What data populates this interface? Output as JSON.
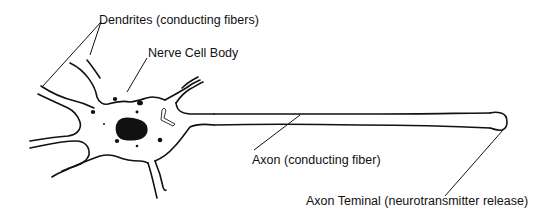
{
  "diagram": {
    "labels": {
      "dendrites": "Dendrites (conducting fibers)",
      "cell_body": "Nerve Cell Body",
      "axon": "Axon (conducting fiber)",
      "axon_terminal": "Axon Teminal (neurotransmitter release)"
    },
    "colors": {
      "line": "#111111",
      "background": "#ffffff",
      "text": "#111111"
    }
  }
}
